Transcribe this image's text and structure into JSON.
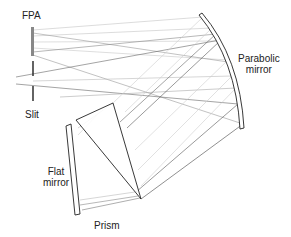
{
  "diagram": {
    "labels": {
      "fpa": "FPA",
      "slit": "Slit",
      "parabolic_line1": "Parabolic",
      "parabolic_line2": "mirror",
      "flat_line1": "Flat",
      "flat_line2": "mirror",
      "prism": "Prism"
    },
    "components": [
      "FPA",
      "Slit",
      "Parabolic mirror",
      "Prism",
      "Flat mirror"
    ],
    "colors": {
      "outline": "#2a2a2a",
      "fpa": "#888888",
      "ray_dark": "#555555",
      "ray_light": "#bbbbbb"
    }
  }
}
